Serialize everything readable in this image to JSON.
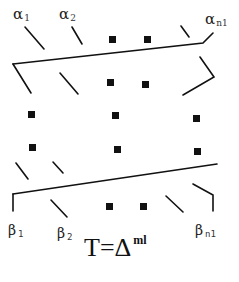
{
  "labels": {
    "alpha_1": {
      "symbol": "α",
      "sub": "1"
    },
    "alpha_2": {
      "symbol": "α",
      "sub": "2"
    },
    "alpha_n1": {
      "symbol": "α",
      "sub": "n1"
    },
    "beta_1": {
      "symbol": "β",
      "sub": "1"
    },
    "beta_2": {
      "symbol": "β",
      "sub": "2"
    },
    "beta_n1": {
      "symbol": "β",
      "sub": "n1"
    }
  },
  "formula": {
    "lhs": "T=Δ",
    "sup": "ml"
  },
  "colors": {
    "stroke": "#111111",
    "fill": "#111111"
  }
}
